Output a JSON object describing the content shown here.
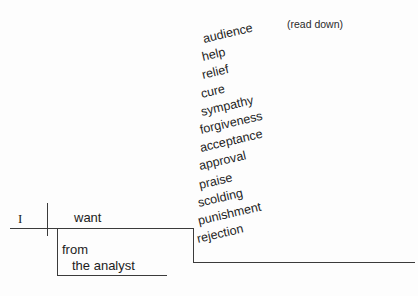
{
  "diagram": {
    "type": "reed-kellogg-sentence-diagram",
    "subject": "I",
    "verb": "want",
    "preposition": "from",
    "prepositional_object": "the analyst",
    "annotation": "(read down)",
    "direct_objects": [
      "audience",
      "help",
      "relief",
      "cure",
      "sympathy",
      "forgiveness",
      "acceptance",
      "approval",
      "praise",
      "scolding",
      "punishment",
      "rejection"
    ],
    "colors": {
      "background": "#fdfdfd",
      "line": "#3b3b3b",
      "text": "#1c1c1c"
    }
  }
}
